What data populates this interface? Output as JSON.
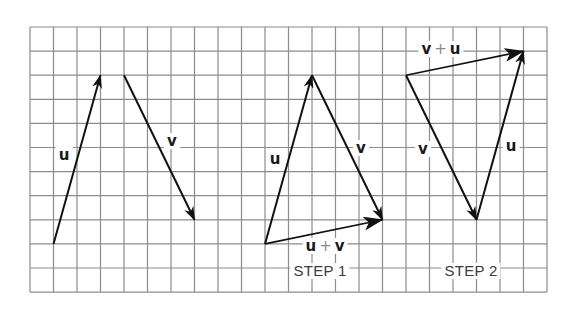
{
  "grid": {
    "origin": [
      30,
      27
    ],
    "cols": 22,
    "rows": 11,
    "cell_w": 23.5,
    "cell_h": 24.1,
    "line_color": "#8c8c8c",
    "vector_color": "#111111"
  },
  "figures": [
    {
      "name": "separate-vectors",
      "vectors": [
        {
          "name": "u",
          "from": [
            1,
            9
          ],
          "to": [
            3,
            2
          ]
        },
        {
          "name": "v",
          "from": [
            4,
            2
          ],
          "to": [
            7,
            8
          ]
        }
      ],
      "labels": [
        {
          "text_a": "u",
          "pos": [
            64,
            155
          ]
        },
        {
          "text_a": "v",
          "pos": [
            172,
            141
          ]
        }
      ]
    },
    {
      "name": "step-1",
      "vectors": [
        {
          "name": "u",
          "from": [
            10,
            9
          ],
          "to": [
            12,
            2
          ]
        },
        {
          "name": "v",
          "from": [
            12,
            2
          ],
          "to": [
            15,
            8
          ]
        },
        {
          "name": "u+v",
          "from": [
            10,
            9
          ],
          "to": [
            15,
            8
          ]
        }
      ],
      "labels": [
        {
          "text_a": "u",
          "pos": [
            275,
            159
          ]
        },
        {
          "text_a": "v",
          "pos": [
            361,
            148
          ]
        }
      ],
      "sum_label": {
        "left": "u",
        "op": "+",
        "right": "v",
        "pos": [
          325,
          246
        ]
      },
      "step_label": {
        "text": "STEP 1",
        "pos": [
          320,
          271
        ]
      }
    },
    {
      "name": "step-2",
      "vectors": [
        {
          "name": "v",
          "from": [
            16,
            2
          ],
          "to": [
            19,
            8
          ]
        },
        {
          "name": "u",
          "from": [
            19,
            8
          ],
          "to": [
            21,
            1
          ]
        },
        {
          "name": "v+u",
          "from": [
            16,
            2
          ],
          "to": [
            21,
            1
          ]
        }
      ],
      "labels": [
        {
          "text_a": "v",
          "pos": [
            423,
            149
          ]
        },
        {
          "text_a": "u",
          "pos": [
            511,
            146
          ]
        }
      ],
      "sum_label": {
        "left": "v",
        "op": "+",
        "right": "u",
        "pos": [
          441,
          49
        ]
      },
      "step_label": {
        "text": "STEP 2",
        "pos": [
          471,
          271
        ]
      }
    }
  ]
}
